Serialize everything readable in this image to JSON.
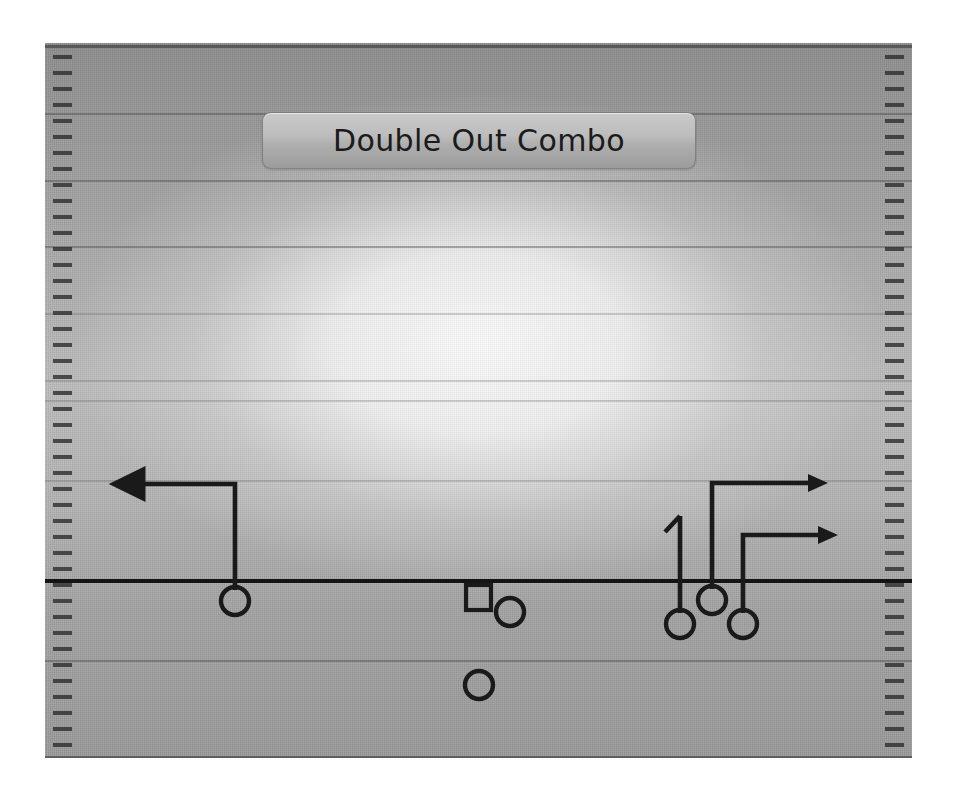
{
  "play": {
    "title": "Double Out Combo",
    "formation_name": "Double Out Combo",
    "line_of_scrimmage_y": 581,
    "colors": {
      "route_stroke": "#1a1a1a",
      "player_stroke": "#1a1a1a",
      "field_light": "#bdbdbd",
      "field_dark": "#8d8d8d",
      "yardline": "#464646",
      "title_text": "#1b1b1b",
      "button_face": "#bdbdbd"
    },
    "field": {
      "left": 45,
      "top": 43,
      "width": 867,
      "height": 715,
      "yard_lines_y": [
        45,
        113,
        180,
        246,
        313,
        380,
        400,
        480,
        581,
        660,
        756
      ],
      "hash_spacing_px": 16,
      "hash_mark_count_per_side": 42,
      "sideline_hashes": true
    },
    "players": [
      {
        "id": "WR-left",
        "symbol": "circle",
        "x": 235,
        "y": 601,
        "label": ""
      },
      {
        "id": "C-center",
        "symbol": "square",
        "x": 478,
        "y": 597,
        "label": ""
      },
      {
        "id": "QB-right-of-C",
        "symbol": "circle",
        "x": 510,
        "y": 612,
        "label": ""
      },
      {
        "id": "RB-backfield",
        "symbol": "circle",
        "x": 479,
        "y": 685,
        "label": ""
      },
      {
        "id": "WR-inside-right",
        "symbol": "circle",
        "x": 680,
        "y": 624,
        "label": ""
      },
      {
        "id": "WR-slot-right",
        "symbol": "circle",
        "x": 712,
        "y": 600,
        "label": ""
      },
      {
        "id": "WR-outside-right",
        "symbol": "circle",
        "x": 743,
        "y": 624,
        "label": ""
      }
    ],
    "routes": [
      {
        "id": "route-left-out",
        "player": "WR-left",
        "type": "out",
        "direction": "left",
        "end_marker": "arrow",
        "points": [
          [
            235,
            590
          ],
          [
            235,
            484
          ],
          [
            134,
            484
          ]
        ]
      },
      {
        "id": "route-inside-right-go",
        "player": "WR-inside-right",
        "type": "go-with-flag",
        "direction": "up",
        "end_marker": "flag",
        "points": [
          [
            680,
            613
          ],
          [
            680,
            517
          ]
        ]
      },
      {
        "id": "route-slot-right-out",
        "player": "WR-slot-right",
        "type": "out",
        "direction": "right",
        "end_marker": "arrow",
        "points": [
          [
            712,
            589
          ],
          [
            712,
            483
          ],
          [
            814,
            483
          ]
        ]
      },
      {
        "id": "route-outside-right-out",
        "player": "WR-outside-right",
        "type": "out",
        "direction": "right",
        "end_marker": "arrow",
        "points": [
          [
            743,
            613
          ],
          [
            743,
            535
          ],
          [
            825,
            535
          ]
        ]
      }
    ]
  }
}
